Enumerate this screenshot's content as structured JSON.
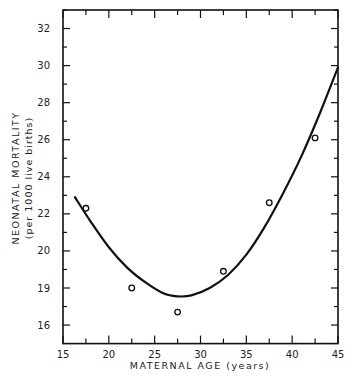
{
  "chart_data": {
    "type": "scatter",
    "title": "",
    "xlabel": "MATERNAL AGE (years)",
    "ylabel": "NEONATAL MORTALITY",
    "ylabel_sub": "(per 1000 live births)",
    "xlim": [
      15,
      45
    ],
    "ylim": [
      15,
      33
    ],
    "x_ticks": [
      15,
      20,
      25,
      30,
      35,
      40,
      45
    ],
    "x_tick_labels": [
      "15",
      "20",
      "25",
      "30",
      "35",
      "40",
      "45"
    ],
    "y_ticks": [
      16,
      18,
      20,
      22,
      24,
      26,
      28,
      30,
      32
    ],
    "y_tick_labels": [
      "16",
      "19",
      "20",
      "22",
      "24",
      "26",
      "28",
      "30",
      "32"
    ],
    "grid": false,
    "legend": null,
    "series": [
      {
        "name": "observed",
        "kind": "scatter",
        "marker": "open-circle",
        "x": [
          17.5,
          22.5,
          27.5,
          32.5,
          37.5,
          42.5
        ],
        "y": [
          22.3,
          18.0,
          16.7,
          18.9,
          22.6,
          26.1
        ]
      },
      {
        "name": "fitted curve",
        "kind": "line",
        "x": [
          16.3,
          18,
          20,
          22,
          24,
          26,
          27.5,
          29,
          31,
          33,
          35,
          37,
          39,
          41,
          43,
          45
        ],
        "y": [
          22.9,
          21.6,
          20.2,
          19.1,
          18.3,
          17.7,
          17.55,
          17.6,
          18.0,
          18.7,
          19.8,
          21.3,
          23.1,
          25.1,
          27.4,
          29.9
        ]
      }
    ]
  }
}
